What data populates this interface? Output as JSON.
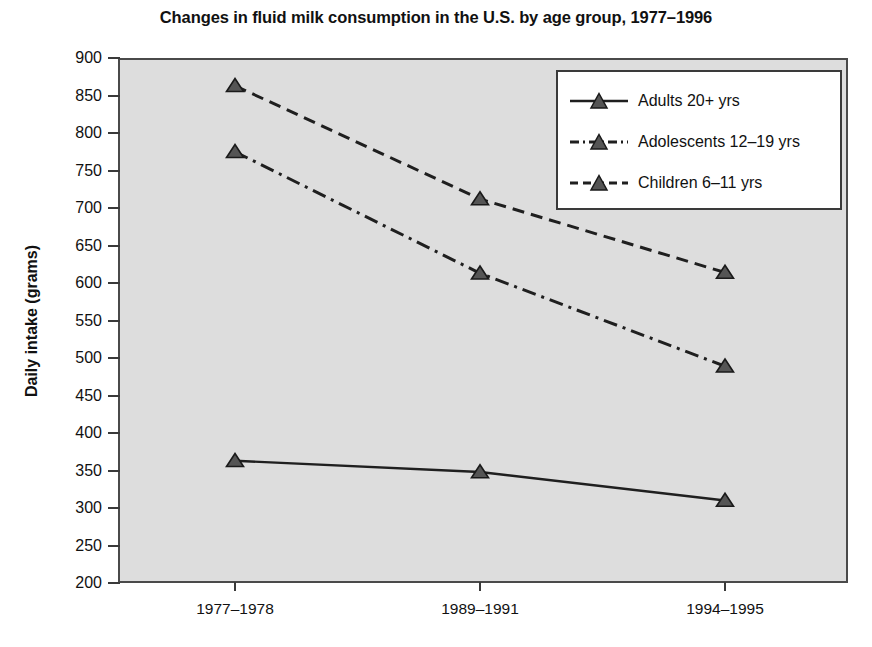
{
  "chart_data": {
    "type": "line",
    "title": "Changes in fluid milk consumption in the U.S. by age group, 1977–1996",
    "xlabel": "",
    "ylabel": "Daily intake (grams)",
    "categories": [
      "1977–1978",
      "1989–1991",
      "1994–1995"
    ],
    "series": [
      {
        "name": "Adults 20+ yrs",
        "values": [
          363,
          348,
          310
        ],
        "line_style": "solid",
        "marker": "triangle",
        "color": "#555555"
      },
      {
        "name": "Adolescents 12–19 yrs",
        "values": [
          775,
          613,
          489
        ],
        "line_style": "dash-dot",
        "marker": "triangle",
        "color": "#555555"
      },
      {
        "name": "Children 6–11 yrs",
        "values": [
          863,
          712,
          614
        ],
        "line_style": "dashed",
        "marker": "triangle",
        "color": "#555555"
      }
    ],
    "ylim": [
      200,
      900
    ],
    "ytick_step": 50,
    "yticks": [
      900,
      850,
      800,
      750,
      700,
      650,
      600,
      550,
      500,
      450,
      400,
      350,
      300,
      250,
      200
    ],
    "ytick_labels": [
      "900",
      "850",
      "800",
      "750",
      "700",
      "650",
      "600",
      "550",
      "500",
      "450",
      "400",
      "350",
      "300",
      "250",
      "200"
    ],
    "grid": false,
    "legend_position": "top-right",
    "plot_background_color": "#dddddd",
    "axis_color": "#4a4a4a",
    "marker_color": "#555555",
    "figure_background_color": "#ffffff"
  },
  "legend": {
    "entries": [
      {
        "label": "Adults 20+ yrs",
        "style": "solid"
      },
      {
        "label": "Adolescents 12–19 yrs",
        "style": "dash-dot"
      },
      {
        "label": "Children 6–11 yrs",
        "style": "dashed"
      }
    ]
  }
}
